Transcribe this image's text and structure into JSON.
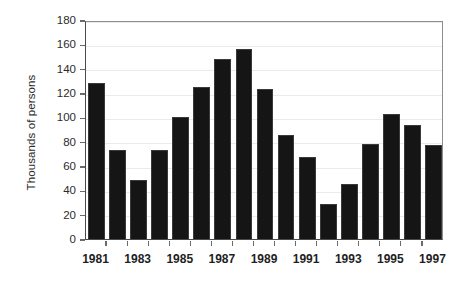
{
  "chart_data": {
    "type": "bar",
    "title": "",
    "subtitle": "",
    "xlabel": "",
    "ylabel": "Thousands of persons",
    "categories": [
      "1981",
      "1982",
      "1983",
      "1984",
      "1985",
      "1986",
      "1987",
      "1988",
      "1989",
      "1990",
      "1991",
      "1992",
      "1993",
      "1994",
      "1995",
      "1996",
      "1997"
    ],
    "values": [
      128,
      73,
      48.5,
      73.5,
      100,
      125,
      148,
      156.5,
      123.5,
      85.5,
      67,
      28.5,
      45,
      78.5,
      102.5,
      94,
      77
    ],
    "xtick_labels": [
      "1981",
      "1983",
      "1985",
      "1987",
      "1989",
      "1991",
      "1993",
      "1995",
      "1997"
    ],
    "ytick_labels": [
      "0",
      "20",
      "40",
      "60",
      "80",
      "100",
      "120",
      "140",
      "160",
      "180"
    ],
    "ytick_values": [
      0,
      20,
      40,
      60,
      80,
      100,
      120,
      140,
      160,
      180
    ],
    "ylim": [
      0,
      180
    ],
    "grid": "horizontal",
    "legend": "none",
    "bar_color": "#151515",
    "gridline_color": "#ebebeb",
    "axis_color": "#4a4a4a",
    "text_color": "#2b2b2b",
    "background_color": "#ffffff"
  }
}
